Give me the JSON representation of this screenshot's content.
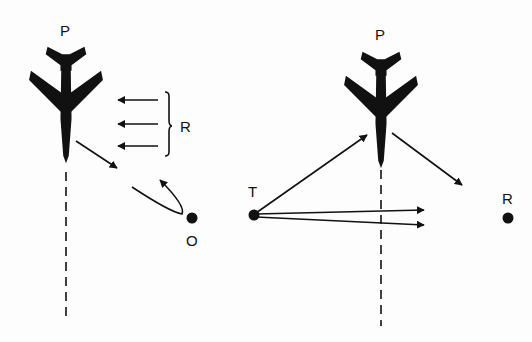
{
  "diagram": {
    "left_panel": {
      "aircraft_label": "P",
      "reflection_label": "R",
      "object_label": "O"
    },
    "right_panel": {
      "aircraft_label": "P",
      "transmitter_label": "T",
      "receiver_label": "R"
    },
    "colors": {
      "ink": "#111111",
      "background": "#fdfdfd"
    }
  }
}
